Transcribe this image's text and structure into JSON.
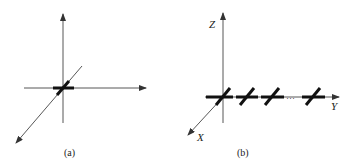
{
  "figure": {
    "panels": [
      {
        "id": "a",
        "caption": "(a)",
        "description": "3D coordinate axes with a single thick dipole element at the origin",
        "axes_labels": {
          "x": "",
          "y": "",
          "z": ""
        },
        "elements": 1
      },
      {
        "id": "b",
        "caption": "(b)",
        "description": "Array of thick crossed elements along the Y axis",
        "axes_labels": {
          "x": "X",
          "y": "Y",
          "z": "Z"
        },
        "ellipsis": "···",
        "elements": 4
      }
    ],
    "colors": {
      "line": "#333333",
      "thick": "#111111",
      "background": "#ffffff"
    }
  }
}
